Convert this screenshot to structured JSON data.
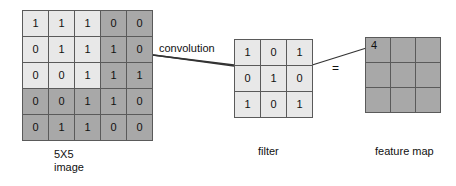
{
  "diagram": {
    "operation_label": "convolution",
    "equals_label": "=",
    "colors": {
      "cell_dark": "#a8a8a8",
      "cell_light": "#e8e8e8",
      "grid_line": "#5a5a5a",
      "text": "#111111",
      "background": "#ffffff"
    }
  },
  "image_matrix": {
    "caption": "5X5\nimage",
    "rows": 5,
    "cols": 5,
    "highlight_window": {
      "row_start": 0,
      "col_start": 0,
      "rows": 3,
      "cols": 3
    },
    "values": [
      [
        "1",
        "1",
        "1",
        "0",
        "0"
      ],
      [
        "0",
        "1",
        "1",
        "1",
        "0"
      ],
      [
        "0",
        "0",
        "1",
        "1",
        "1"
      ],
      [
        "0",
        "0",
        "1",
        "1",
        "0"
      ],
      [
        "0",
        "1",
        "1",
        "0",
        "0"
      ]
    ],
    "shades": [
      [
        "light",
        "light",
        "light",
        "dark",
        "dark"
      ],
      [
        "light",
        "light",
        "light",
        "dark",
        "dark"
      ],
      [
        "light",
        "light",
        "light",
        "dark",
        "dark"
      ],
      [
        "dark",
        "dark",
        "dark",
        "dark",
        "dark"
      ],
      [
        "dark",
        "dark",
        "dark",
        "dark",
        "dark"
      ]
    ]
  },
  "filter_matrix": {
    "caption": "filter",
    "rows": 3,
    "cols": 3,
    "values": [
      [
        "1",
        "0",
        "1"
      ],
      [
        "0",
        "1",
        "0"
      ],
      [
        "1",
        "0",
        "1"
      ]
    ],
    "shades": [
      [
        "light",
        "light",
        "light"
      ],
      [
        "light",
        "light",
        "light"
      ],
      [
        "light",
        "light",
        "light"
      ]
    ]
  },
  "feature_map": {
    "caption": "feature map",
    "rows": 3,
    "cols": 3,
    "values": [
      [
        "4",
        "",
        ""
      ],
      [
        "",
        "",
        ""
      ],
      [
        "",
        "",
        ""
      ]
    ],
    "shades": [
      [
        "dark",
        "dark",
        "dark"
      ],
      [
        "dark",
        "dark",
        "dark"
      ],
      [
        "dark",
        "dark",
        "dark"
      ]
    ]
  }
}
